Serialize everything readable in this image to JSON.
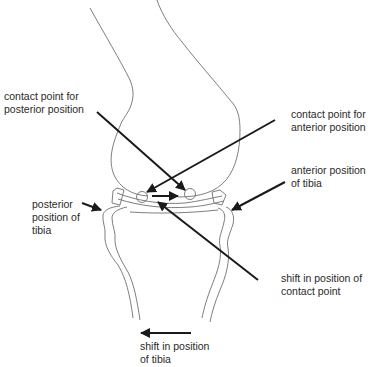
{
  "figure": {
    "colors": {
      "background": "#ffffff",
      "outline": "#6f6f6f",
      "pointer": "#1a1a1a",
      "text": "#2a2a2a"
    }
  },
  "labels": {
    "contact_posterior": {
      "line1": "contact point for",
      "line2": "posterior position"
    },
    "contact_anterior": {
      "line1": "contact point for",
      "line2": "anterior position"
    },
    "anterior_tibia": {
      "line1": "anterior position",
      "line2": "of tibia"
    },
    "posterior_tibia": {
      "line1": "posterior",
      "line2": "position of",
      "line3": "tibia"
    },
    "shift_contact": {
      "line1": "shift in position of",
      "line2": "contact point"
    },
    "shift_tibia": {
      "line1": "shift in position",
      "line2": "of tibia"
    }
  }
}
